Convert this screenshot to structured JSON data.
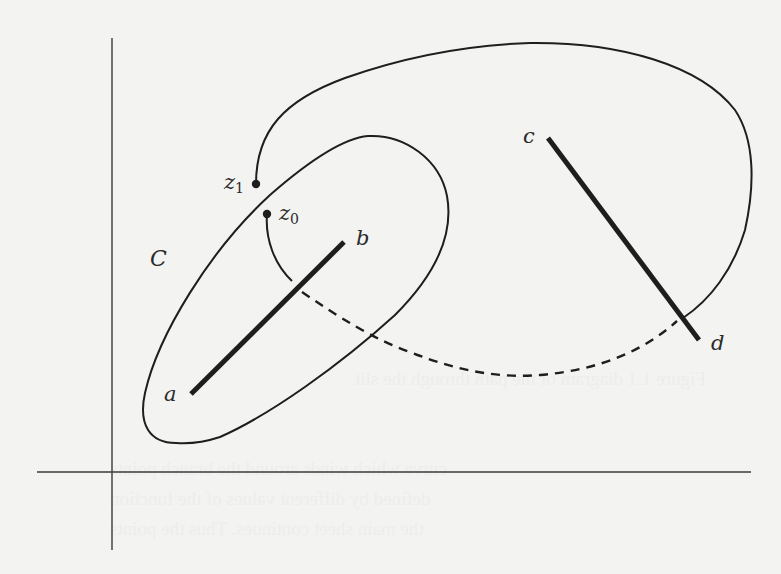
{
  "figure": {
    "colors": {
      "background": "#f3f3f1",
      "ink": "#1e1e1e"
    },
    "labels": {
      "z1": "z",
      "z1_sub": "1",
      "z0": "z",
      "z0_sub": "0",
      "a": "a",
      "b": "b",
      "c": "c",
      "d": "d",
      "C": "C"
    },
    "axes": {
      "vertical": {
        "x": 112,
        "y1": 38,
        "y2": 550
      },
      "horizontal": {
        "y": 472,
        "x1": 37,
        "x2": 751
      }
    },
    "segments": [
      {
        "name": "a-b",
        "from": [
          191,
          394
        ],
        "to": [
          344,
          242
        ]
      },
      {
        "name": "c-d",
        "from": [
          548,
          138
        ],
        "to": [
          699,
          340
        ]
      }
    ],
    "points": [
      {
        "name": "z1",
        "x": 256,
        "y": 184
      },
      {
        "name": "z0",
        "x": 267,
        "y": 214
      }
    ],
    "curves": {
      "contour_C": "closed loop around segment a-b",
      "outer_path": "from z1 up over top, around right of c-d, ending at d-side",
      "dashed_path": "from slit a-b crossing down to slit c-d (on lower sheet)"
    },
    "bleed_through_text": [
      "Figure 1.1 diagram of the path through the slit",
      "curve which winds around the branch points",
      "defined by different values of the function",
      "the main sheet continues. Thus the points"
    ]
  }
}
